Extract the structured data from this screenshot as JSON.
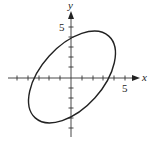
{
  "figure": {
    "x_axis_label": "x",
    "y_axis_label": "y",
    "x_tick_label": "5",
    "y_tick_label": "5",
    "curve": "rotated ellipse centered at origin",
    "colors": {
      "stroke": "#222222",
      "background": "#ffffff"
    }
  }
}
